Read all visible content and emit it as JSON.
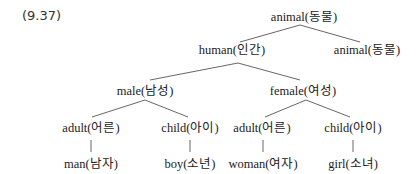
{
  "example_number": "(9.37)",
  "tree": {
    "root": {
      "label": "animal(동물)"
    },
    "level1": [
      {
        "label": "human(인간)"
      },
      {
        "label": "animal(동물)"
      }
    ],
    "level2": [
      {
        "label": "male(남성)"
      },
      {
        "label": "female(여성)"
      }
    ],
    "level3": [
      {
        "label": "adult(어른)"
      },
      {
        "label": "child(아이)"
      },
      {
        "label": "adult(어른)"
      },
      {
        "label": "child(아이)"
      }
    ],
    "leaves": [
      {
        "label": "man(남자)"
      },
      {
        "label": "boy(소년)"
      },
      {
        "label": "woman(여자)"
      },
      {
        "label": "girl(소녀)"
      }
    ]
  }
}
